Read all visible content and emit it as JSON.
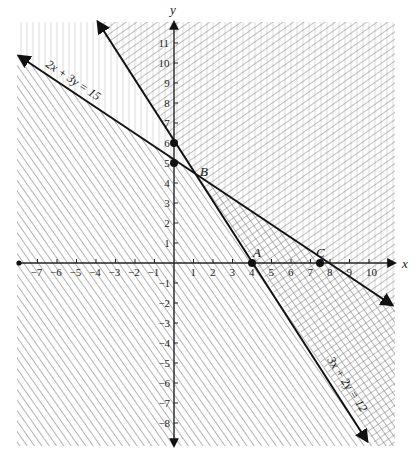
{
  "figure": {
    "axes": {
      "x_label": "x",
      "y_label": "y",
      "x_ticks": [
        -7,
        -6,
        -5,
        -4,
        -3,
        -2,
        -1,
        1,
        2,
        3,
        4,
        5,
        6,
        7,
        8,
        9,
        10
      ],
      "y_ticks": [
        -8,
        -7,
        -6,
        -5,
        -4,
        -3,
        -2,
        -1,
        1,
        2,
        3,
        4,
        5,
        6,
        7,
        8,
        9,
        10,
        11
      ],
      "x_range": [
        -8,
        11.5
      ],
      "y_range": [
        -9,
        12
      ]
    },
    "lines": [
      {
        "id": "line1",
        "label": "2x + 3y = 15",
        "a": 2,
        "b": 3,
        "c": 15
      },
      {
        "id": "line2",
        "label": "3x + 2y = 12",
        "a": 3,
        "b": 2,
        "c": 12
      }
    ],
    "points": [
      {
        "label": "",
        "x": 0,
        "y": 6
      },
      {
        "label": "",
        "x": 0,
        "y": 5
      },
      {
        "label": "B",
        "x": 1.2,
        "y": 4.2
      },
      {
        "label": "A",
        "x": 4,
        "y": 0
      },
      {
        "label": "C",
        "x": 7.5,
        "y": 0
      }
    ],
    "regions": [
      {
        "name": "below 2x+3y=15",
        "pattern": "diagonal-down"
      },
      {
        "name": "above 3x+2y=12",
        "pattern": "diagonal-up"
      },
      {
        "name": "feasible overlap",
        "pattern": "crosshatch"
      }
    ],
    "colors": {
      "line": "#111111",
      "hatch": "#8a8a8a",
      "hatch_light": "#d6d6d6",
      "axis": "#222222"
    }
  },
  "caption": {
    "visible_text": ""
  }
}
